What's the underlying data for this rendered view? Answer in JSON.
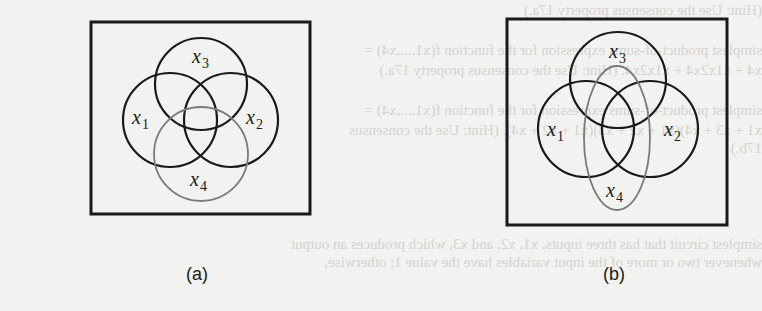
{
  "figure": {
    "background_color": "#f2f2f0",
    "ink_color": "#1a1a1a",
    "x4_color": "#7a7a7a",
    "bleed_through_text": [
      {
        "y": 2,
        "text": "(Hint: Use the consensus property 17a.)"
      },
      {
        "y": 42,
        "text": "simplest product-of-sums expression for the function f(x1,...,x4) ="
      },
      {
        "y": 62,
        "text": "x4 + x1x2x4 + x1x2x4. (Hint: Use the consensus property 17a.)"
      },
      {
        "y": 102,
        "text": "simplest product-of-sums expression for the function f(x1,...,x4) ="
      },
      {
        "y": 122,
        "text": "x1 + x3 + x4)(x1 + x2 + x3)(x1 + x2 + x4). (Hint: Use the consensus"
      },
      {
        "y": 140,
        "text": "17b.)"
      },
      {
        "y": 236,
        "text": "simplest circuit that has three inputs, x1, x2, and x3, which produces an output"
      },
      {
        "y": 254,
        "text": "whenever two or more of the input variables have the value 1; otherwise,"
      }
    ],
    "panels": [
      {
        "id": "a",
        "caption": "(a)",
        "caption_pos": {
          "x": 186,
          "y": 264
        },
        "frame": {
          "x": 91,
          "y": 22,
          "w": 219,
          "h": 192
        },
        "shapes": [
          {
            "var": "x1",
            "kind": "circle",
            "cx": 170,
            "cy": 120,
            "r": 47,
            "gray": false
          },
          {
            "var": "x2",
            "kind": "circle",
            "cx": 231,
            "cy": 120,
            "r": 47,
            "gray": false
          },
          {
            "var": "x3",
            "kind": "circle",
            "cx": 201,
            "cy": 84,
            "r": 46,
            "gray": false
          },
          {
            "var": "x4",
            "kind": "circle",
            "cx": 201,
            "cy": 154,
            "r": 47,
            "gray": true
          }
        ],
        "labels": [
          {
            "base": "x",
            "sub": "1",
            "x": 132,
            "y": 124
          },
          {
            "base": "x",
            "sub": "2",
            "x": 246,
            "y": 124
          },
          {
            "base": "x",
            "sub": "3",
            "x": 192,
            "y": 63
          },
          {
            "base": "x",
            "sub": "4",
            "x": 190,
            "y": 186
          }
        ]
      },
      {
        "id": "b",
        "caption": "(b)",
        "caption_pos": {
          "x": 603,
          "y": 264
        },
        "frame": {
          "x": 507,
          "y": 19,
          "w": 220,
          "h": 206
        },
        "shapes": [
          {
            "var": "x1",
            "kind": "circle",
            "cx": 586,
            "cy": 129,
            "r": 48,
            "gray": false
          },
          {
            "var": "x2",
            "kind": "circle",
            "cx": 650,
            "cy": 129,
            "r": 48,
            "gray": false
          },
          {
            "var": "x3",
            "kind": "circle",
            "cx": 618,
            "cy": 80,
            "r": 48,
            "gray": false
          },
          {
            "var": "x4",
            "kind": "ellipse",
            "cx": 617,
            "cy": 138,
            "rx": 33,
            "ry": 72,
            "gray": true
          }
        ],
        "labels": [
          {
            "base": "x",
            "sub": "1",
            "x": 547,
            "y": 136
          },
          {
            "base": "x",
            "sub": "2",
            "x": 664,
            "y": 136
          },
          {
            "base": "x",
            "sub": "3",
            "x": 609,
            "y": 58
          },
          {
            "base": "x",
            "sub": "4",
            "x": 606,
            "y": 197
          }
        ]
      }
    ]
  }
}
